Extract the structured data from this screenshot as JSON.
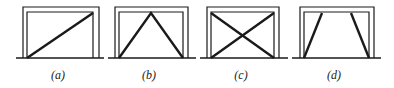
{
  "figure": {
    "panels": [
      {
        "label": "(a)",
        "bracing": "single-diagonal"
      },
      {
        "label": "(b)",
        "bracing": "inverted-V"
      },
      {
        "label": "(c)",
        "bracing": "X-cross"
      },
      {
        "label": "(d)",
        "bracing": "knee-braces"
      }
    ],
    "colors": {
      "line": "#1a1a1a",
      "background": "#ffffff"
    }
  }
}
